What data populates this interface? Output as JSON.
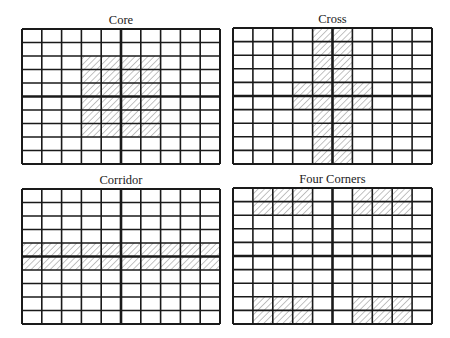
{
  "figure": {
    "background": "#ffffff",
    "line_color": "#1a1a1a",
    "hatch_color": "#7a7a7a",
    "grid": {
      "rows": 10,
      "cols": 10
    }
  },
  "panels": [
    {
      "id": "core",
      "title": "Core",
      "box": {
        "x": 22,
        "y": 29,
        "w": 198,
        "h": 135
      },
      "hatched_cells": {
        "rows": [
          2,
          3,
          4,
          5,
          6,
          7
        ],
        "cols": [
          3,
          4,
          5,
          6
        ]
      }
    },
    {
      "id": "cross",
      "title": "Cross",
      "box": {
        "x": 233,
        "y": 28,
        "w": 199,
        "h": 136
      },
      "hatched_cells_list": [
        [
          0,
          4
        ],
        [
          0,
          5
        ],
        [
          1,
          4
        ],
        [
          1,
          5
        ],
        [
          2,
          4
        ],
        [
          2,
          5
        ],
        [
          3,
          4
        ],
        [
          3,
          5
        ],
        [
          4,
          3
        ],
        [
          4,
          4
        ],
        [
          4,
          5
        ],
        [
          4,
          6
        ],
        [
          5,
          3
        ],
        [
          5,
          4
        ],
        [
          5,
          5
        ],
        [
          5,
          6
        ],
        [
          6,
          4
        ],
        [
          6,
          5
        ],
        [
          7,
          4
        ],
        [
          7,
          5
        ],
        [
          8,
          4
        ],
        [
          8,
          5
        ],
        [
          9,
          4
        ],
        [
          9,
          5
        ]
      ]
    },
    {
      "id": "corridor",
      "title": "Corridor",
      "box": {
        "x": 22,
        "y": 189,
        "w": 198,
        "h": 135
      },
      "hatched_cells": {
        "rows": [
          4,
          5
        ],
        "cols": [
          0,
          1,
          2,
          3,
          4,
          5,
          6,
          7,
          8,
          9
        ]
      }
    },
    {
      "id": "four-corners",
      "title": "Four Corners",
      "box": {
        "x": 233,
        "y": 188,
        "w": 199,
        "h": 136
      },
      "hatched_cells": {
        "rows": [
          0,
          1,
          8,
          9
        ],
        "cols": [
          1,
          2,
          3,
          6,
          7,
          8
        ]
      }
    }
  ]
}
